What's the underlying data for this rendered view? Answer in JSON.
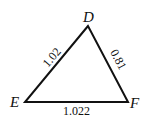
{
  "diagram": {
    "type": "triangle",
    "vertices": [
      {
        "label": "D",
        "x": 88,
        "y": 26
      },
      {
        "label": "E",
        "x": 25,
        "y": 102
      },
      {
        "label": "F",
        "x": 128,
        "y": 102
      }
    ],
    "sides": [
      {
        "between": "DE",
        "length": "1.02"
      },
      {
        "between": "DF",
        "length": "0.81"
      },
      {
        "between": "EF",
        "length": "1.022"
      }
    ],
    "stroke_color": "#111111"
  }
}
